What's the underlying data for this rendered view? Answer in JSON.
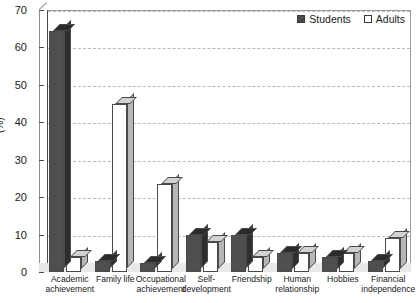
{
  "chart_data": {
    "type": "bar",
    "title": "",
    "xlabel": "",
    "ylabel": "(%)",
    "ylim": [
      0,
      70
    ],
    "yticks": [
      0,
      10,
      20,
      30,
      40,
      50,
      60,
      70
    ],
    "grid": true,
    "legend_position": "top-right",
    "categories": [
      "Academic achievement",
      "Family life",
      "Occupational achievement",
      "Self-development",
      "Friendship",
      "Human relationship",
      "Hobbies",
      "Financial independence"
    ],
    "category_lines": [
      [
        "Academic",
        "achievement"
      ],
      [
        "Family life",
        ""
      ],
      [
        "Occupational",
        "achievement"
      ],
      [
        "Self-",
        "development"
      ],
      [
        "Friendship",
        ""
      ],
      [
        "Human",
        "relationship"
      ],
      [
        "Hobbies",
        ""
      ],
      [
        "Financial",
        "independence"
      ]
    ],
    "series": [
      {
        "name": "Students",
        "color": "#4f4f4f",
        "values": [
          64.5,
          3.0,
          2.5,
          10.0,
          10.0,
          5.0,
          4.0,
          3.0
        ]
      },
      {
        "name": "Adults",
        "color": "#ffffff",
        "values": [
          4.0,
          45.0,
          23.5,
          8.0,
          4.0,
          5.0,
          5.0,
          9.0
        ]
      }
    ]
  },
  "legend": {
    "items": [
      {
        "label": "Students",
        "style": "dark"
      },
      {
        "label": "Adults",
        "style": "light"
      }
    ]
  },
  "axis": {
    "y_title": "(%)",
    "y_labels": [
      "70",
      "60",
      "50",
      "40",
      "30",
      "20",
      "10",
      "0"
    ]
  }
}
